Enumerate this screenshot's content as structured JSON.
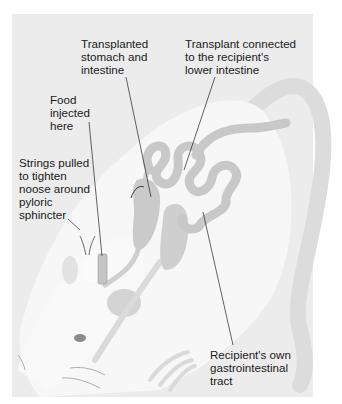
{
  "figure": {
    "colors": {
      "background": "#ececec",
      "body": "#f7f7f7",
      "organ": "#c9c9c9",
      "tail": "#dcdcdc",
      "line": "#222222",
      "text": "#1a1a1a"
    }
  },
  "labels": {
    "transplanted_stomach": "Transplanted\nstomach and\nintestine",
    "transplant_connected": "Transplant connected\nto the recipient's\nlower intestine",
    "food_injected": "Food\ninjected\nhere",
    "strings_pulled": "Strings pulled\nto tighten\nnoose around\npyloric\nsphincter",
    "recipient_gi": "Recipient's own\ngastrointestinal\ntract"
  }
}
